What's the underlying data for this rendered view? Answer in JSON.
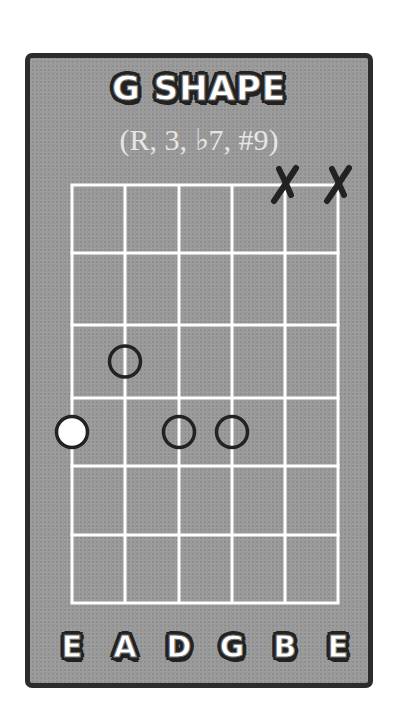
{
  "title": "G SHAPE",
  "subtitle": "(R, 3, ♭7, #9)",
  "colors": {
    "card_bg": "#9a9a9a",
    "card_border": "#2c2c2c",
    "grid_lines": "#ffffff",
    "dot_stroke": "#222222",
    "root_fill": "#ffffff",
    "mute_mark": "#222222"
  },
  "fretboard": {
    "strings": 6,
    "frets_shown": 6,
    "string_x": [
      42,
      95,
      149,
      202,
      255,
      308
    ],
    "fret_y": [
      127,
      195,
      267,
      340,
      408,
      477,
      545
    ],
    "string_names": [
      "E",
      "A",
      "D",
      "G",
      "B",
      "E"
    ]
  },
  "muted_strings": [
    {
      "string": "B",
      "index": 4,
      "symbol": "X"
    },
    {
      "string": "E",
      "index": 5,
      "symbol": "X"
    }
  ],
  "notes": [
    {
      "string": "A",
      "index": 1,
      "fret": 3,
      "degree": "3",
      "type": "tone"
    },
    {
      "string": "E",
      "index": 0,
      "fret": 4,
      "degree": "R",
      "type": "root"
    },
    {
      "string": "D",
      "index": 2,
      "fret": 4,
      "degree": "b7",
      "type": "tone"
    },
    {
      "string": "G",
      "index": 3,
      "fret": 4,
      "degree": "#9",
      "type": "tone"
    }
  ]
}
